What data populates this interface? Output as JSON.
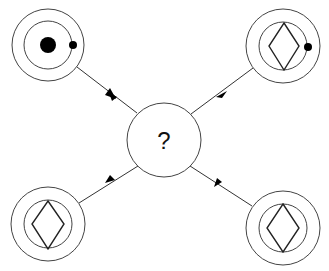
{
  "diagram": {
    "type": "puzzle-analogy",
    "center": {
      "label": "?",
      "cx": 164,
      "cy": 140,
      "r": 37
    },
    "nodes": [
      {
        "id": "top-left",
        "cx": 48,
        "cy": 45,
        "inner_shape": "large-dot",
        "has_small_dot": true
      },
      {
        "id": "top-right",
        "cx": 283,
        "cy": 46,
        "inner_shape": "diamond",
        "has_small_dot": true
      },
      {
        "id": "bottom-left",
        "cx": 48,
        "cy": 224,
        "inner_shape": "diamond",
        "has_small_dot": false
      },
      {
        "id": "bottom-right",
        "cx": 283,
        "cy": 228,
        "inner_shape": "diamond",
        "has_small_dot": false
      }
    ],
    "edges": [
      {
        "from": "top-left",
        "to": "center",
        "arrow": "midpoint-toward-center"
      },
      {
        "from": "top-right",
        "to": "center",
        "arrow": "midpoint-toward-center"
      },
      {
        "from": "bottom-left",
        "to": "center",
        "arrow": "midpoint-toward-center"
      },
      {
        "from": "bottom-right",
        "to": "center",
        "arrow": "midpoint-toward-center"
      }
    ],
    "colors": {
      "stroke": "#444444",
      "fill": "#000000",
      "background": "#ffffff"
    }
  }
}
